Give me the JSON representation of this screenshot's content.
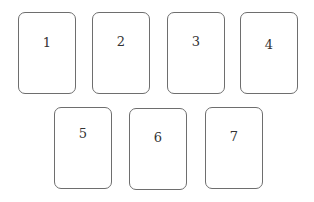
{
  "cards": [
    {
      "label": "1",
      "x": 18,
      "y": 12,
      "label_top": 22
    },
    {
      "label": "2",
      "x": 92,
      "y": 12,
      "label_top": 21
    },
    {
      "label": "3",
      "x": 167,
      "y": 12,
      "label_top": 21
    },
    {
      "label": "4",
      "x": 240,
      "y": 12,
      "label_top": 24
    },
    {
      "label": "5",
      "x": 54,
      "y": 107,
      "label_top": 18
    },
    {
      "label": "6",
      "x": 129,
      "y": 108,
      "label_top": 21
    },
    {
      "label": "7",
      "x": 205,
      "y": 107,
      "label_top": 21
    }
  ]
}
